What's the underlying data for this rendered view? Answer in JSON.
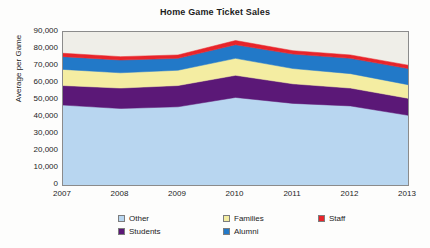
{
  "chart_data": {
    "type": "area",
    "stacked": true,
    "title": "Home Game Ticket Sales",
    "xlabel": "",
    "ylabel": "Average per Game",
    "categories": [
      "2007",
      "2008",
      "2009",
      "2010",
      "2011",
      "2012",
      "2013"
    ],
    "x": [
      2007,
      2008,
      2009,
      2010,
      2011,
      2012,
      2013
    ],
    "ylim": [
      0,
      90000
    ],
    "ytick_step": 10000,
    "ytick_labels": [
      "0",
      "10,000",
      "20,000",
      "30,000",
      "40,000",
      "50,000",
      "60,000",
      "70,000",
      "80,000",
      "90,000"
    ],
    "ytick_values": [
      0,
      10000,
      20000,
      30000,
      40000,
      50000,
      60000,
      70000,
      80000,
      90000
    ],
    "grid": false,
    "legend_position": "bottom",
    "series": [
      {
        "name": "Other",
        "color": "#b8d6f0",
        "values": [
          47000,
          45000,
          46000,
          51500,
          48000,
          46500,
          41000
        ]
      },
      {
        "name": "Students",
        "color": "#5b1877",
        "values": [
          11500,
          12000,
          12500,
          13000,
          11500,
          10500,
          10000
        ]
      },
      {
        "name": "Families",
        "color": "#f4eda2",
        "values": [
          9500,
          9000,
          9000,
          10000,
          9000,
          8500,
          8000
        ]
      },
      {
        "name": "Alumni",
        "color": "#2279c8",
        "values": [
          7500,
          7500,
          7000,
          8000,
          8500,
          9000,
          9500
        ]
      },
      {
        "name": "Staff",
        "color": "#e8242a",
        "values": [
          2000,
          2000,
          2000,
          2500,
          2000,
          2000,
          2000
        ]
      }
    ],
    "stack_totals": [
      77500,
      75500,
      76500,
      85000,
      79000,
      76500,
      70500
    ]
  },
  "legend": {
    "items": [
      {
        "label": "Other",
        "color": "#b8d6f0"
      },
      {
        "label": "Students",
        "color": "#5b1877"
      },
      {
        "label": "Families",
        "color": "#f4eda2"
      },
      {
        "label": "Alumni",
        "color": "#2279c8"
      },
      {
        "label": "Staff",
        "color": "#e8242a"
      }
    ]
  },
  "colors": {
    "plot_background": "#efeee8",
    "frame": "#8b8b8b",
    "text": "#1c1c1c",
    "page_background": "#fdfdfc"
  }
}
